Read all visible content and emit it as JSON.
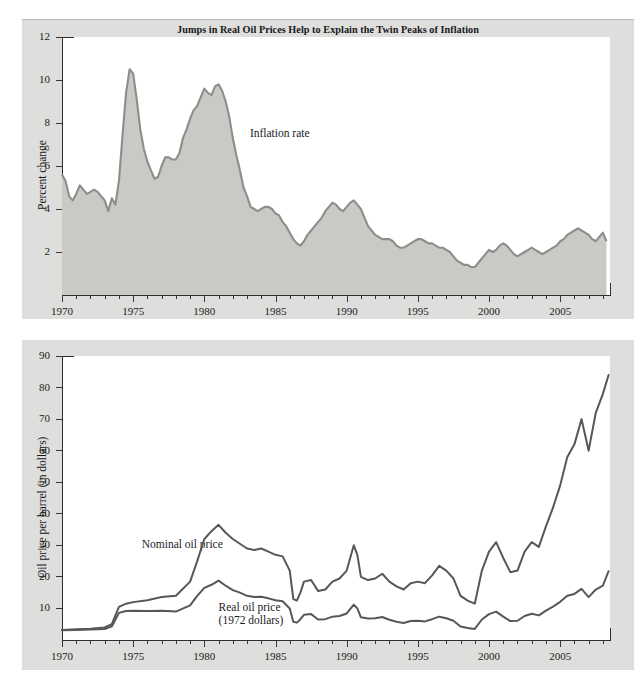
{
  "figure": {
    "title": "Jumps in Real Oil Prices Help to Explain the Twin Peaks of Inflation",
    "background_color": "#dededc",
    "plot_background_color": "#ffffff"
  },
  "chart_data": [
    {
      "type": "area",
      "title": "Jumps in Real Oil Prices Help to Explain the Twin Peaks of Inflation",
      "panel": "top",
      "xlabel": "",
      "ylabel": "Percent change",
      "xlim": [
        1970,
        2008.5
      ],
      "ylim": [
        0,
        12
      ],
      "yticks": [
        2,
        4,
        6,
        8,
        10,
        12
      ],
      "xticks": [
        1970,
        1975,
        1980,
        1985,
        1990,
        1995,
        2000,
        2005
      ],
      "grid": false,
      "legend_position": "inline-annotation",
      "annotations": [
        {
          "text": "Inflation rate",
          "x": 1983.2,
          "y": 7.5
        }
      ],
      "series": [
        {
          "name": "Inflation rate",
          "line_color": "#8d8d8a",
          "fill_color": "#c9c9c6",
          "x": [
            1970.0,
            1970.25,
            1970.5,
            1970.75,
            1971.0,
            1971.25,
            1971.5,
            1971.75,
            1972.0,
            1972.25,
            1972.5,
            1972.75,
            1973.0,
            1973.25,
            1973.5,
            1973.75,
            1974.0,
            1974.25,
            1974.5,
            1974.75,
            1975.0,
            1975.25,
            1975.5,
            1975.75,
            1976.0,
            1976.25,
            1976.5,
            1976.75,
            1977.0,
            1977.25,
            1977.5,
            1977.75,
            1978.0,
            1978.25,
            1978.5,
            1978.75,
            1979.0,
            1979.25,
            1979.5,
            1979.75,
            1980.0,
            1980.25,
            1980.5,
            1980.75,
            1981.0,
            1981.25,
            1981.5,
            1981.75,
            1982.0,
            1982.25,
            1982.5,
            1982.75,
            1983.0,
            1983.25,
            1983.5,
            1983.75,
            1984.0,
            1984.25,
            1984.5,
            1984.75,
            1985.0,
            1985.25,
            1985.5,
            1985.75,
            1986.0,
            1986.25,
            1986.5,
            1986.75,
            1987.0,
            1987.25,
            1987.5,
            1987.75,
            1988.0,
            1988.25,
            1988.5,
            1988.75,
            1989.0,
            1989.25,
            1989.5,
            1989.75,
            1990.0,
            1990.25,
            1990.5,
            1990.75,
            1991.0,
            1991.25,
            1991.5,
            1991.75,
            1992.0,
            1992.25,
            1992.5,
            1992.75,
            1993.0,
            1993.25,
            1993.5,
            1993.75,
            1994.0,
            1994.25,
            1994.5,
            1994.75,
            1995.0,
            1995.25,
            1995.5,
            1995.75,
            1996.0,
            1996.25,
            1996.5,
            1996.75,
            1997.0,
            1997.25,
            1997.5,
            1997.75,
            1998.0,
            1998.25,
            1998.5,
            1998.75,
            1999.0,
            1999.25,
            1999.5,
            1999.75,
            2000.0,
            2000.25,
            2000.5,
            2000.75,
            2001.0,
            2001.25,
            2001.5,
            2001.75,
            2002.0,
            2002.25,
            2002.5,
            2002.75,
            2003.0,
            2003.25,
            2003.5,
            2003.75,
            2004.0,
            2004.25,
            2004.5,
            2004.75,
            2005.0,
            2005.25,
            2005.5,
            2005.75,
            2006.0,
            2006.25,
            2006.5,
            2006.75,
            2007.0,
            2007.25,
            2007.5,
            2007.75,
            2008.0,
            2008.25
          ],
          "y": [
            5.6,
            5.3,
            4.6,
            4.4,
            4.7,
            5.1,
            4.9,
            4.7,
            4.8,
            4.9,
            4.8,
            4.6,
            4.4,
            3.9,
            4.5,
            4.2,
            5.3,
            7.4,
            9.4,
            10.5,
            10.3,
            9.1,
            7.7,
            6.8,
            6.2,
            5.8,
            5.4,
            5.5,
            6.0,
            6.4,
            6.4,
            6.3,
            6.3,
            6.6,
            7.3,
            7.7,
            8.2,
            8.6,
            8.8,
            9.2,
            9.6,
            9.4,
            9.3,
            9.7,
            9.8,
            9.5,
            9.0,
            8.3,
            7.3,
            6.5,
            5.8,
            5.0,
            4.6,
            4.1,
            4.0,
            3.9,
            4.0,
            4.1,
            4.1,
            4.0,
            3.8,
            3.7,
            3.4,
            3.2,
            2.9,
            2.6,
            2.4,
            2.3,
            2.5,
            2.8,
            3.0,
            3.2,
            3.4,
            3.6,
            3.9,
            4.1,
            4.3,
            4.2,
            4.0,
            3.9,
            4.1,
            4.3,
            4.4,
            4.2,
            4.0,
            3.6,
            3.2,
            3.0,
            2.8,
            2.7,
            2.6,
            2.6,
            2.6,
            2.5,
            2.3,
            2.2,
            2.2,
            2.3,
            2.4,
            2.5,
            2.6,
            2.6,
            2.5,
            2.4,
            2.4,
            2.3,
            2.2,
            2.2,
            2.1,
            2.0,
            1.8,
            1.6,
            1.5,
            1.4,
            1.4,
            1.3,
            1.3,
            1.5,
            1.7,
            1.9,
            2.1,
            2.0,
            2.1,
            2.3,
            2.4,
            2.3,
            2.1,
            1.9,
            1.8,
            1.9,
            2.0,
            2.1,
            2.2,
            2.1,
            2.0,
            1.9,
            2.0,
            2.1,
            2.2,
            2.3,
            2.5,
            2.6,
            2.8,
            2.9,
            3.0,
            3.1,
            3.0,
            2.9,
            2.8,
            2.6,
            2.5,
            2.7,
            2.9,
            2.5
          ]
        }
      ]
    },
    {
      "type": "line",
      "panel": "bottom",
      "xlabel": "",
      "ylabel": "Oil price per barrel (in dollars)",
      "xlim": [
        1970,
        2008.5
      ],
      "ylim": [
        0,
        90
      ],
      "yticks": [
        10,
        20,
        30,
        40,
        50,
        60,
        70,
        80,
        90
      ],
      "xticks": [
        1970,
        1975,
        1980,
        1985,
        1990,
        1995,
        2000,
        2005
      ],
      "grid": false,
      "legend_position": "inline-annotation",
      "annotations": [
        {
          "text": "Nominal oil price",
          "x": 1975.6,
          "y": 30.0
        },
        {
          "text": "Real oil price",
          "x": 1981.0,
          "y": 10.2
        },
        {
          "text": "(1972 dollars)",
          "x": 1981.0,
          "y": 7.4
        }
      ],
      "series": [
        {
          "name": "Nominal oil price",
          "line_color": "#57575a",
          "x": [
            1970.0,
            1971.0,
            1972.0,
            1973.0,
            1973.5,
            1974.0,
            1974.5,
            1975.0,
            1976.0,
            1977.0,
            1978.0,
            1979.0,
            1979.5,
            1980.0,
            1980.5,
            1981.0,
            1981.5,
            1982.0,
            1982.5,
            1983.0,
            1983.5,
            1984.0,
            1984.5,
            1985.0,
            1985.5,
            1986.0,
            1986.25,
            1986.5,
            1986.75,
            1987.0,
            1987.5,
            1988.0,
            1988.5,
            1989.0,
            1989.5,
            1990.0,
            1990.5,
            1990.75,
            1991.0,
            1991.5,
            1992.0,
            1992.5,
            1993.0,
            1993.5,
            1994.0,
            1994.5,
            1995.0,
            1995.5,
            1996.0,
            1996.5,
            1997.0,
            1997.5,
            1998.0,
            1998.5,
            1999.0,
            1999.5,
            2000.0,
            2000.5,
            2001.0,
            2001.5,
            2002.0,
            2002.5,
            2003.0,
            2003.5,
            2004.0,
            2004.5,
            2005.0,
            2005.5,
            2006.0,
            2006.5,
            2007.0,
            2007.5,
            2008.0,
            2008.4
          ],
          "y": [
            3.2,
            3.4,
            3.6,
            4.0,
            5.0,
            10.5,
            11.5,
            12.0,
            12.6,
            13.6,
            14.0,
            18.5,
            25.0,
            32.0,
            34.5,
            36.5,
            34.0,
            32.0,
            30.5,
            29.0,
            28.5,
            29.0,
            28.0,
            27.0,
            26.5,
            22.0,
            13.0,
            12.5,
            15.0,
            18.5,
            19.0,
            15.5,
            16.0,
            18.5,
            19.5,
            22.0,
            30.0,
            27.0,
            20.0,
            19.0,
            19.5,
            21.0,
            18.5,
            17.0,
            16.0,
            18.0,
            18.5,
            18.0,
            20.5,
            23.5,
            22.0,
            19.5,
            14.0,
            12.5,
            11.5,
            22.0,
            28.0,
            31.0,
            26.0,
            21.5,
            22.0,
            28.0,
            31.0,
            29.5,
            36.0,
            42.0,
            49.0,
            58.0,
            62.0,
            70.0,
            60.0,
            72.0,
            78.0,
            84.0
          ]
        },
        {
          "name": "Real oil price (1972 dollars)",
          "line_color": "#57575a",
          "x": [
            1970.0,
            1971.0,
            1972.0,
            1973.0,
            1973.5,
            1974.0,
            1974.5,
            1975.0,
            1976.0,
            1977.0,
            1978.0,
            1979.0,
            1979.5,
            1980.0,
            1980.5,
            1981.0,
            1981.5,
            1982.0,
            1982.5,
            1983.0,
            1983.5,
            1984.0,
            1984.5,
            1985.0,
            1985.5,
            1986.0,
            1986.25,
            1986.5,
            1986.75,
            1987.0,
            1987.5,
            1988.0,
            1988.5,
            1989.0,
            1989.5,
            1990.0,
            1990.5,
            1990.75,
            1991.0,
            1991.5,
            1992.0,
            1992.5,
            1993.0,
            1993.5,
            1994.0,
            1994.5,
            1995.0,
            1995.5,
            1996.0,
            1996.5,
            1997.0,
            1997.5,
            1998.0,
            1998.5,
            1999.0,
            1999.5,
            2000.0,
            2000.5,
            2001.0,
            2001.5,
            2002.0,
            2002.5,
            2003.0,
            2003.5,
            2004.0,
            2004.5,
            2005.0,
            2005.5,
            2006.0,
            2006.5,
            2007.0,
            2007.5,
            2008.0,
            2008.4
          ],
          "y": [
            3.1,
            3.2,
            3.3,
            3.5,
            4.3,
            8.6,
            9.2,
            9.3,
            9.2,
            9.3,
            9.0,
            11.0,
            14.0,
            16.5,
            17.5,
            18.8,
            17.2,
            15.8,
            15.0,
            14.0,
            13.6,
            13.7,
            13.2,
            12.6,
            12.3,
            10.0,
            5.8,
            5.5,
            6.6,
            8.0,
            8.2,
            6.5,
            6.6,
            7.4,
            7.6,
            8.4,
            11.2,
            10.0,
            7.2,
            6.8,
            6.9,
            7.3,
            6.4,
            5.8,
            5.4,
            6.0,
            6.1,
            5.9,
            6.6,
            7.4,
            6.9,
            6.1,
            4.3,
            3.8,
            3.5,
            6.5,
            8.2,
            9.0,
            7.4,
            6.0,
            6.1,
            7.6,
            8.3,
            7.8,
            9.3,
            10.6,
            12.1,
            14.0,
            14.6,
            16.2,
            13.6,
            16.0,
            17.2,
            21.8
          ]
        }
      ]
    }
  ],
  "top_chart": {
    "ylabel": "Percent change",
    "yticks": [
      "12",
      "10",
      "8",
      "6",
      "4",
      "2"
    ],
    "xticks": [
      "1970",
      "1975",
      "1980",
      "1985",
      "1990",
      "1995",
      "2000",
      "2005"
    ],
    "annotation": "Inflation rate"
  },
  "bottom_chart": {
    "ylabel": "Oil price per barrel (in dollars)",
    "yticks": [
      "90",
      "80",
      "70",
      "60",
      "50",
      "40",
      "30",
      "20",
      "10"
    ],
    "xticks": [
      "1970",
      "1975",
      "1980",
      "1985",
      "1990",
      "1995",
      "2000",
      "2005"
    ],
    "annotation_nominal": "Nominal oil price",
    "annotation_real_line1": "Real oil price",
    "annotation_real_line2": "(1972 dollars)"
  }
}
